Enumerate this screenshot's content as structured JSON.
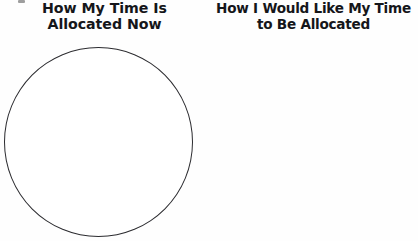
{
  "document": {
    "background_color": "#fefefe",
    "ink_color": "#2b2b2f"
  },
  "panels": [
    {
      "id": "current-allocation",
      "title_line_1": "How My Time Is",
      "title_line_2": "Allocated Now",
      "chart": {
        "name": "empty-pie-chart",
        "shape": "circle",
        "filled": false,
        "segments": []
      }
    },
    {
      "id": "desired-allocation",
      "title_line_1": "How I Would Like My Time",
      "title_line_2": "to Be Allocated",
      "chart": {
        "name": "empty-pie-chart",
        "shape": "circle",
        "filled": false,
        "segments": []
      }
    }
  ],
  "chart_data": [
    {
      "type": "pie",
      "title": "How My Time Is Allocated Now",
      "labels": [],
      "values": [],
      "legend": "none",
      "notes": "Blank unsegmented circle outline for the reader to fill in"
    },
    {
      "type": "pie",
      "title": "How I Would Like My Time to Be Allocated",
      "labels": [],
      "values": [],
      "legend": "none",
      "notes": "Blank unsegmented circle outline for the reader to fill in"
    }
  ]
}
